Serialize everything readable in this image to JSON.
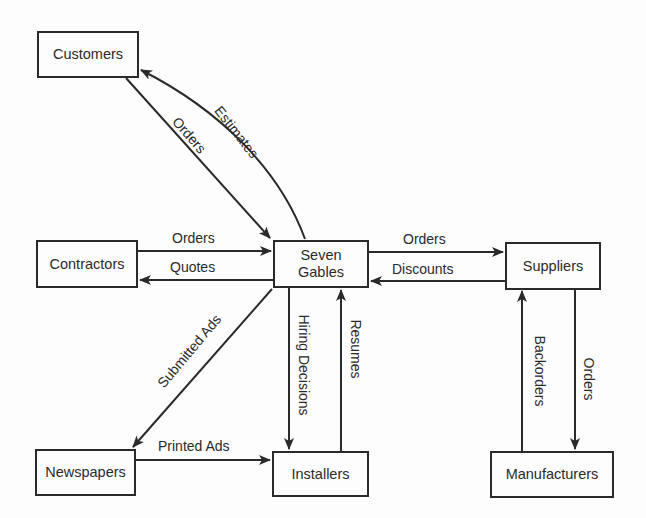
{
  "diagram": {
    "type": "context-diagram",
    "center": "Seven Gables",
    "nodes": [
      {
        "id": "customers",
        "label": "Customers"
      },
      {
        "id": "contractors",
        "label": "Contractors"
      },
      {
        "id": "seven_gables",
        "label": "Seven Gables",
        "line1": "Seven",
        "line2": "Gables"
      },
      {
        "id": "suppliers",
        "label": "Suppliers"
      },
      {
        "id": "newspapers",
        "label": "Newspapers"
      },
      {
        "id": "installers",
        "label": "Installers"
      },
      {
        "id": "manufacturers",
        "label": "Manufacturers"
      }
    ],
    "edges": [
      {
        "from": "customers",
        "to": "seven_gables",
        "label": "Orders"
      },
      {
        "from": "seven_gables",
        "to": "customers",
        "label": "Estimates"
      },
      {
        "from": "contractors",
        "to": "seven_gables",
        "label": "Orders"
      },
      {
        "from": "seven_gables",
        "to": "contractors",
        "label": "Quotes"
      },
      {
        "from": "seven_gables",
        "to": "suppliers",
        "label": "Orders"
      },
      {
        "from": "suppliers",
        "to": "seven_gables",
        "label": "Discounts"
      },
      {
        "from": "seven_gables",
        "to": "newspapers",
        "label": "Submitted Ads"
      },
      {
        "from": "newspapers",
        "to": "installers",
        "label": "Printed Ads"
      },
      {
        "from": "seven_gables",
        "to": "installers",
        "label": "Hiring Decisions"
      },
      {
        "from": "installers",
        "to": "seven_gables",
        "label": "Resumes"
      },
      {
        "from": "suppliers",
        "to": "manufacturers",
        "label": "Orders"
      },
      {
        "from": "manufacturers",
        "to": "suppliers",
        "label": "Backorders"
      }
    ]
  }
}
